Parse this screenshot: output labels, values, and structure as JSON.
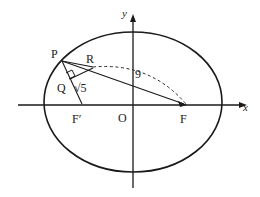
{
  "figure": {
    "axes": {
      "x_label": "x",
      "y_label": "x_origin_label_unused",
      "y_axis_label": "y",
      "origin_label": "O"
    },
    "points": [
      {
        "id": "P",
        "label": "P",
        "x": 62,
        "y": 61
      },
      {
        "id": "Q",
        "label": "Q",
        "x": 72,
        "y": 82
      },
      {
        "id": "R",
        "label": "R",
        "x": 92,
        "y": 68
      },
      {
        "id": "F1",
        "label": "F′",
        "x": 82,
        "y": 105
      },
      {
        "id": "F2",
        "label": "F",
        "x": 186,
        "y": 105
      },
      {
        "id": "O",
        "label": "O",
        "x": 133,
        "y": 105
      }
    ],
    "measures": [
      {
        "id": "seg-qr",
        "label": "√5",
        "meaning": "length of segment from Q to R"
      },
      {
        "id": "arc-rf",
        "label": "9",
        "meaning": "length marked along dashed arc from R to F"
      }
    ],
    "marks": {
      "right_angle": "right-angle at Q between PF-prime and the segment through R"
    },
    "colors": {
      "stroke": "#1a1a1a",
      "background": "#ffffff",
      "dashed": "#2a2a2a"
    }
  }
}
